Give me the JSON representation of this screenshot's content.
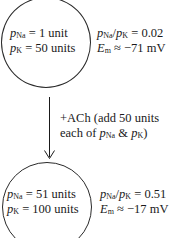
{
  "top_state": {
    "circle_lines": [
      {
        "var": "p",
        "sub": "Na",
        "rest": " = 1 unit"
      },
      {
        "var": "p",
        "sub": "K",
        "rest": " = 50 units"
      }
    ],
    "ratio": {
      "lhs_a": "p",
      "sub_a": "Na",
      "slash": "/",
      "lhs_b": "p",
      "sub_b": "K",
      "rest": " = 0.02"
    },
    "em": {
      "var": "E",
      "sub": "m",
      "rest": " ≈ −71 mV"
    }
  },
  "transition": {
    "line1": "+ACh (add 50 units",
    "line2_prefix": "each of ",
    "line2_p1": "p",
    "line2_sub1": "Na",
    "line2_amp": " & ",
    "line2_p2": "p",
    "line2_sub2": "K",
    "line2_suffix": ")"
  },
  "bottom_state": {
    "circle_lines": [
      {
        "var": "p",
        "sub": "Na",
        "rest": " = 51 units"
      },
      {
        "var": "p",
        "sub": "K",
        "rest": " = 100 units"
      }
    ],
    "ratio": {
      "lhs_a": "p",
      "sub_a": "Na",
      "slash": "/",
      "lhs_b": "p",
      "sub_b": "K",
      "rest": " = 0.51"
    },
    "em": {
      "var": "E",
      "sub": "m",
      "rest": " ≈ −17 mV"
    }
  }
}
